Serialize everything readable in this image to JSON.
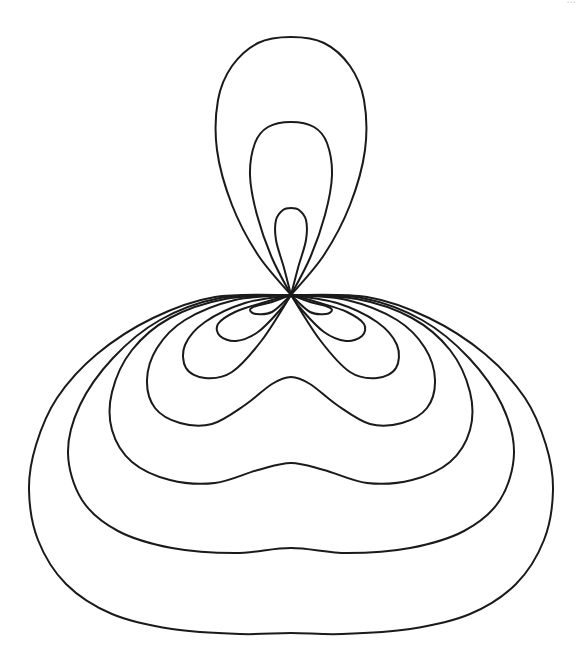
{
  "diagram": {
    "title": "",
    "center": [
      291,
      295
    ],
    "stroke_color": "#1a1a1a",
    "background": "#ffffff",
    "watermark": "...",
    "curves": [
      {
        "name": "curve-1-inner",
        "loops": [
          [
            [
              291,
              295
            ],
            [
              284,
              268
            ],
            [
              276,
              240
            ],
            [
              276,
              220
            ],
            [
              283,
              210
            ],
            [
              291,
              208
            ]
          ],
          [
            [
              291,
              295
            ],
            [
              272,
              302
            ],
            [
              256,
              306
            ],
            [
              250,
              310
            ],
            [
              256,
              314
            ],
            [
              272,
              312
            ],
            [
              291,
              295
            ]
          ]
        ]
      },
      {
        "name": "curve-2",
        "loops": [
          [
            [
              291,
              295
            ],
            [
              272,
              258
            ],
            [
              257,
              215
            ],
            [
              250,
              175
            ],
            [
              255,
              143
            ],
            [
              268,
              127
            ],
            [
              291,
              122
            ]
          ],
          [
            [
              291,
              295
            ],
            [
              262,
              303
            ],
            [
              235,
              312
            ],
            [
              218,
              324
            ],
            [
              220,
              336
            ],
            [
              236,
              341
            ],
            [
              258,
              332
            ],
            [
              280,
              310
            ],
            [
              291,
              295
            ]
          ]
        ]
      },
      {
        "name": "curve-3",
        "loops": [
          [
            [
              291,
              295
            ],
            [
              258,
              255
            ],
            [
              232,
              205
            ],
            [
              217,
              150
            ],
            [
              218,
              100
            ],
            [
              232,
              66
            ],
            [
              258,
              43
            ],
            [
              291,
              37
            ]
          ],
          [
            [
              291,
              295
            ],
            [
              245,
              303
            ],
            [
              205,
              322
            ],
            [
              185,
              345
            ],
            [
              186,
              368
            ],
            [
              205,
              378
            ],
            [
              232,
              372
            ],
            [
              262,
              340
            ],
            [
              291,
              295
            ]
          ]
        ]
      },
      {
        "name": "curve-4",
        "loops": [
          [
            [
              291,
              295
            ],
            [
              235,
              300
            ],
            [
              185,
              320
            ],
            [
              157,
              348
            ],
            [
              147,
              380
            ],
            [
              155,
              408
            ],
            [
              180,
              423
            ],
            [
              212,
              424
            ],
            [
              245,
              405
            ],
            [
              272,
              384
            ],
            [
              291,
              377
            ]
          ]
        ]
      },
      {
        "name": "curve-5",
        "loops": [
          [
            [
              291,
              295
            ],
            [
              225,
              299
            ],
            [
              170,
              318
            ],
            [
              132,
              350
            ],
            [
              112,
              392
            ],
            [
              112,
              430
            ],
            [
              132,
              462
            ],
            [
              170,
              480
            ],
            [
              215,
              483
            ],
            [
              258,
              470
            ],
            [
              291,
              463
            ]
          ]
        ]
      },
      {
        "name": "curve-6",
        "loops": [
          [
            [
              291,
              295
            ],
            [
              220,
              298
            ],
            [
              160,
              320
            ],
            [
              113,
              358
            ],
            [
              80,
              405
            ],
            [
              68,
              453
            ],
            [
              82,
              500
            ],
            [
              118,
              531
            ],
            [
              172,
              548
            ],
            [
              235,
              553
            ],
            [
              291,
              548
            ]
          ]
        ]
      },
      {
        "name": "curve-7-outer",
        "loops": [
          [
            [
              291,
              295
            ],
            [
              215,
              297
            ],
            [
              153,
              318
            ],
            [
              97,
              354
            ],
            [
              57,
              398
            ],
            [
              36,
              445
            ],
            [
              29,
              490
            ],
            [
              38,
              540
            ],
            [
              66,
              584
            ],
            [
              112,
              614
            ],
            [
              172,
              629
            ],
            [
              240,
              634
            ],
            [
              291,
              633
            ]
          ]
        ]
      }
    ]
  }
}
